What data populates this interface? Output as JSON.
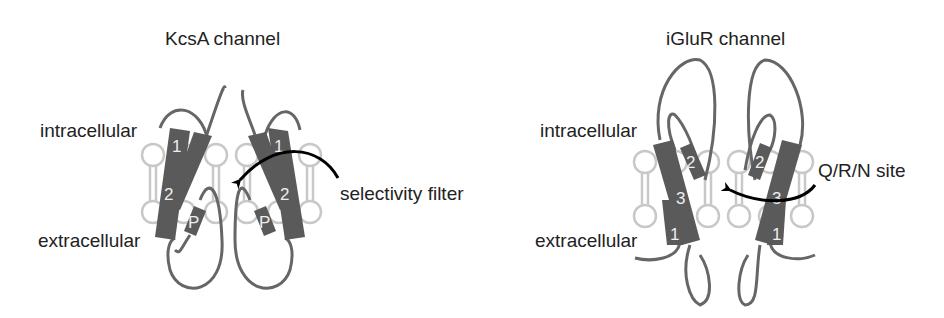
{
  "panels": [
    {
      "title": "KcsA channel",
      "labels": {
        "inside": "intracellular",
        "outside": "extracellular",
        "pointer": "selectivity filter"
      },
      "helices": [
        "1",
        "2",
        "P"
      ]
    },
    {
      "title": "iGluR channel",
      "labels": {
        "inside": "intracellular",
        "outside": "extracellular",
        "pointer": "Q/R/N site"
      },
      "helices": [
        "1",
        "2",
        "3"
      ]
    }
  ],
  "colors": {
    "helix": "#5a5a5a",
    "lipid": "#c8c8c8",
    "loop": "#666666",
    "arrow": "#000000",
    "text": "#222222"
  }
}
